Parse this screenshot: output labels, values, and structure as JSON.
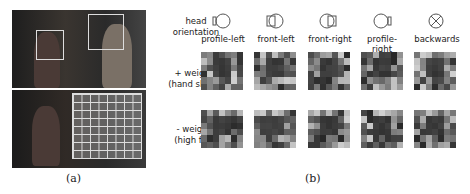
{
  "figure": {
    "panel_a": {
      "caption": "(a)"
    },
    "panel_b": {
      "caption": "(b)"
    },
    "row_labels": {
      "head_orientation": [
        "head",
        "orientation"
      ],
      "positive": [
        "+ weights",
        "(hand shake)"
      ],
      "negative": [
        "- weights",
        "(high five)"
      ]
    },
    "columns": [
      {
        "label": "profile-left",
        "icon": "head-profile-left-icon"
      },
      {
        "label": "front-left",
        "icon": "head-front-left-icon"
      },
      {
        "label": "front-right",
        "icon": "head-front-right-icon"
      },
      {
        "label": "profile-right",
        "icon": "head-profile-right-icon"
      },
      {
        "label": "backwards",
        "icon": "head-backwards-icon"
      }
    ]
  }
}
